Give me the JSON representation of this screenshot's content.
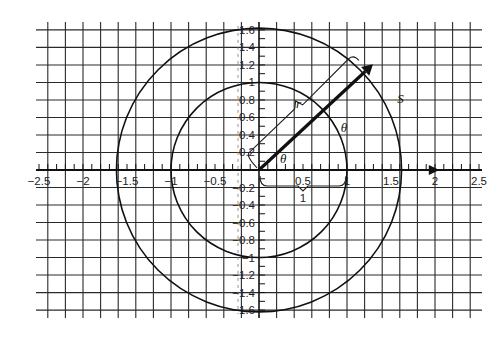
{
  "figure": {
    "origin_px": [
      259,
      170
    ],
    "unit_px": 88,
    "grid_step": 0.2,
    "x_range": [
      -2.5,
      2.5
    ],
    "y_range": [
      -1.6,
      1.6
    ],
    "x_tick_labels": [
      {
        "value": -2.5,
        "text": "−2.5"
      },
      {
        "value": -2,
        "text": "−2"
      },
      {
        "value": -1.5,
        "text": "−1.5"
      },
      {
        "value": -1,
        "text": "−1"
      },
      {
        "value": -0.5,
        "text": "−0.5"
      },
      {
        "value": 0.5,
        "text": "0.5"
      },
      {
        "value": 1,
        "text": "1"
      },
      {
        "value": 1.5,
        "text": "1.5"
      },
      {
        "value": 2,
        "text": "2"
      },
      {
        "value": 2.5,
        "text": "2.5"
      }
    ],
    "y_tick_labels": [
      {
        "value": 1.6,
        "text": "1.6"
      },
      {
        "value": 1.4,
        "text": "1.4"
      },
      {
        "value": 1.2,
        "text": "1.2"
      },
      {
        "value": 1,
        "text": "1"
      },
      {
        "value": 0.8,
        "text": "0.8"
      },
      {
        "value": 0.6,
        "text": "0.6"
      },
      {
        "value": 0.4,
        "text": "0.4"
      },
      {
        "value": 0.2,
        "text": "0.2"
      },
      {
        "value": -0.2,
        "text": "−0.2"
      },
      {
        "value": -0.4,
        "text": "−0.4"
      },
      {
        "value": -0.6,
        "text": "−0.6"
      },
      {
        "value": -0.8,
        "text": "−0.8"
      },
      {
        "value": -1,
        "text": "−1"
      },
      {
        "value": -1.2,
        "text": "−1.2"
      },
      {
        "value": -1.4,
        "text": "−1.4"
      },
      {
        "value": -1.6,
        "text": "−1.6"
      }
    ],
    "circles": [
      {
        "name": "unit-circle",
        "radius": 1
      },
      {
        "name": "outer-circle",
        "radius": 1.62
      }
    ],
    "radius_vector": {
      "angle_deg": 43,
      "length": 1.77
    },
    "labels": {
      "r": "r",
      "theta_inner": "θ",
      "theta_outer": "θ",
      "s": "S",
      "unit_brace": "1"
    },
    "colors": {
      "grid": "#2a2a2a",
      "curve": "#111111",
      "background": "#ffffff"
    }
  }
}
